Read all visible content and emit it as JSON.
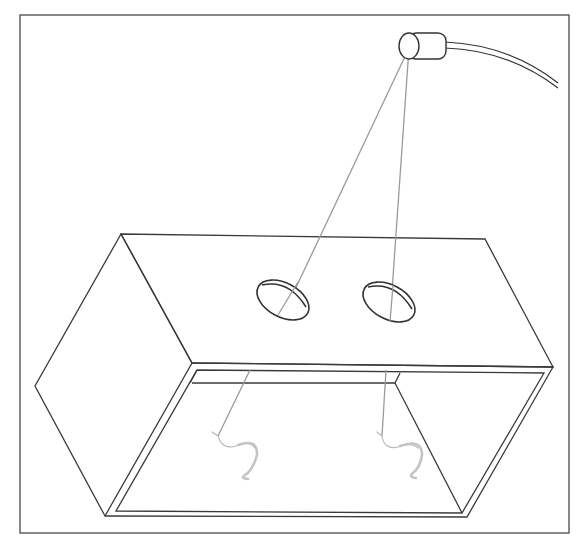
{
  "figure": {
    "description": "Line drawing of an open-bottom box with two holes in its top face; a light source on a cable above shines two beams through the holes onto two worms lying on the floor inside the box.",
    "components": [
      {
        "id": "light-source",
        "label": "Light source with cable"
      },
      {
        "id": "box",
        "label": "Rectangular box (open front, viewed from below-front)"
      },
      {
        "id": "hole-left",
        "label": "Left hole in box top"
      },
      {
        "id": "hole-right",
        "label": "Right hole in box top"
      },
      {
        "id": "beam-left",
        "label": "Light beam through left hole"
      },
      {
        "id": "beam-right",
        "label": "Light beam through right hole"
      },
      {
        "id": "worm-left",
        "label": "Left worm"
      },
      {
        "id": "worm-right",
        "label": "Right worm"
      }
    ],
    "colors": {
      "outline": "#3a3a3a",
      "beam": "#9a9a9a",
      "worm": "#c4c4c4",
      "background": "#ffffff"
    }
  }
}
